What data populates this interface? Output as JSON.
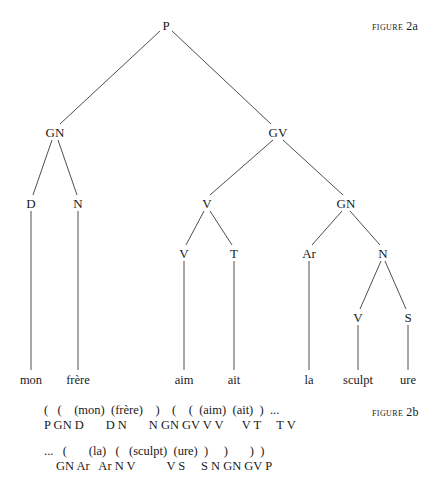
{
  "figure_2a": {
    "label_word": "FIGURE",
    "label_num": "2a",
    "nodes": [
      {
        "id": "P",
        "label": "P",
        "x": 166,
        "y": 25
      },
      {
        "id": "GN1",
        "label": "GN",
        "x": 55,
        "y": 132
      },
      {
        "id": "GV",
        "label": "GV",
        "x": 278,
        "y": 132
      },
      {
        "id": "D",
        "label": "D",
        "x": 31,
        "y": 203
      },
      {
        "id": "N1",
        "label": "N",
        "x": 78,
        "y": 203
      },
      {
        "id": "V1",
        "label": "V",
        "x": 207,
        "y": 203
      },
      {
        "id": "GN2",
        "label": "GN",
        "x": 346,
        "y": 203
      },
      {
        "id": "V2",
        "label": "V",
        "x": 184,
        "y": 253
      },
      {
        "id": "T",
        "label": "T",
        "x": 234,
        "y": 253
      },
      {
        "id": "Ar",
        "label": "Ar",
        "x": 309,
        "y": 253
      },
      {
        "id": "N2",
        "label": "N",
        "x": 383,
        "y": 253
      },
      {
        "id": "V3",
        "label": "V",
        "x": 358,
        "y": 317
      },
      {
        "id": "S",
        "label": "S",
        "x": 408,
        "y": 317
      }
    ],
    "leaves": [
      {
        "label": "mon",
        "x": 31,
        "y": 380
      },
      {
        "label": "frère",
        "x": 78,
        "y": 380
      },
      {
        "label": "aim",
        "x": 184,
        "y": 380
      },
      {
        "label": "ait",
        "x": 234,
        "y": 380
      },
      {
        "label": "la",
        "x": 309,
        "y": 380
      },
      {
        "label": "sculpt",
        "x": 358,
        "y": 380
      },
      {
        "label": "ure",
        "x": 408,
        "y": 380
      }
    ]
  },
  "figure_2b": {
    "label_word": "FIGURE",
    "label_num": "2b",
    "line1_top": "(   (    (mon)  (frère)    )    (    (  (aim)  (ait)  )  ...",
    "line1_bottom": "P GN D       D N       N GN GV V V      V T     T V",
    "line2_top": "...   (       (la)   (   (sculpt)  (ure)  )     )       )  )",
    "line2_bottom": "GN Ar   Ar N V          V S     S N GN GV P"
  }
}
